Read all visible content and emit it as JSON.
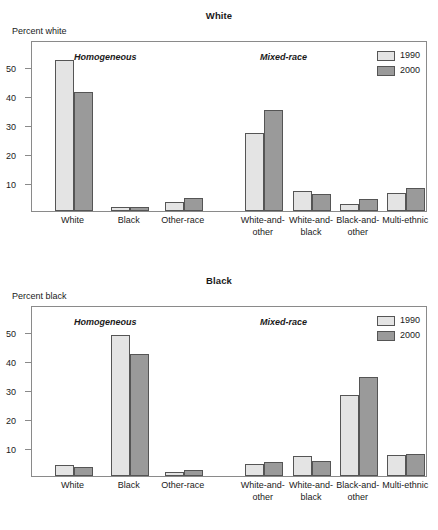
{
  "figure": {
    "clipped_caption": "",
    "series_colors": {
      "y1990": "#e4e4e4",
      "y2000": "#9a9a9a",
      "frame": "#8a8a8a",
      "outline": "#555555"
    },
    "legend": {
      "items": [
        {
          "label": "1990"
        },
        {
          "label": "2000"
        }
      ]
    },
    "sections": {
      "homogeneous": "Homogeneous",
      "mixed": "Mixed-race"
    },
    "categories": [
      {
        "line1": "White",
        "line2": ""
      },
      {
        "line1": "Black",
        "line2": ""
      },
      {
        "line1": "Other-race",
        "line2": ""
      },
      {
        "line1": "White-and-",
        "line2": "other"
      },
      {
        "line1": "White-and-",
        "line2": "black"
      },
      {
        "line1": "Black-and-",
        "line2": "other"
      },
      {
        "line1": "Multi-ethnic",
        "line2": ""
      }
    ],
    "yticks": [
      "10",
      "20",
      "30",
      "40",
      "50"
    ]
  },
  "chart_data": [
    {
      "type": "bar",
      "title": "White",
      "ylabel": "Percent white",
      "xlabel": "",
      "ylim": [
        0,
        59
      ],
      "grid": false,
      "legend_position": "top-right",
      "ytick_values": [
        10,
        20,
        30,
        40,
        50
      ],
      "categories": [
        "White",
        "Black",
        "Other-race",
        "White-and-other",
        "White-and-black",
        "Black-and-other",
        "Multi-ethnic"
      ],
      "group_sections": [
        "Homogeneous",
        "Homogeneous",
        "Homogeneous",
        "Mixed-race",
        "Mixed-race",
        "Mixed-race",
        "Mixed-race"
      ],
      "series": [
        {
          "name": "1990",
          "values": [
            52.0,
            1.5,
            3.0,
            27.0,
            7.0,
            2.5,
            6.3
          ]
        },
        {
          "name": "2000",
          "values": [
            41.0,
            1.3,
            4.5,
            35.0,
            6.0,
            4.0,
            8.0
          ]
        }
      ]
    },
    {
      "type": "bar",
      "title": "Black",
      "ylabel": "Percent black",
      "xlabel": "",
      "ylim": [
        0,
        59
      ],
      "grid": false,
      "legend_position": "top-right",
      "ytick_values": [
        10,
        20,
        30,
        40,
        50
      ],
      "categories": [
        "White",
        "Black",
        "Other-race",
        "White-and-other",
        "White-and-black",
        "Black-and-other",
        "Multi-ethnic"
      ],
      "group_sections": [
        "Homogeneous",
        "Homogeneous",
        "Homogeneous",
        "Mixed-race",
        "Mixed-race",
        "Mixed-race",
        "Mixed-race"
      ],
      "series": [
        {
          "name": "1990",
          "values": [
            3.8,
            48.5,
            1.3,
            4.0,
            6.8,
            28.0,
            7.2
          ]
        },
        {
          "name": "2000",
          "values": [
            3.0,
            42.0,
            2.2,
            5.0,
            5.3,
            34.0,
            7.7
          ]
        }
      ]
    }
  ]
}
